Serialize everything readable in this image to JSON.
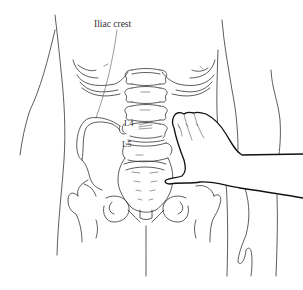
{
  "figure": {
    "labels": {
      "iliac_crest": "Iliac crest",
      "l4": "L4",
      "l5": "L5"
    },
    "colors": {
      "line": "#333333",
      "hand_outline": "#111111",
      "background": "#ffffff"
    }
  }
}
